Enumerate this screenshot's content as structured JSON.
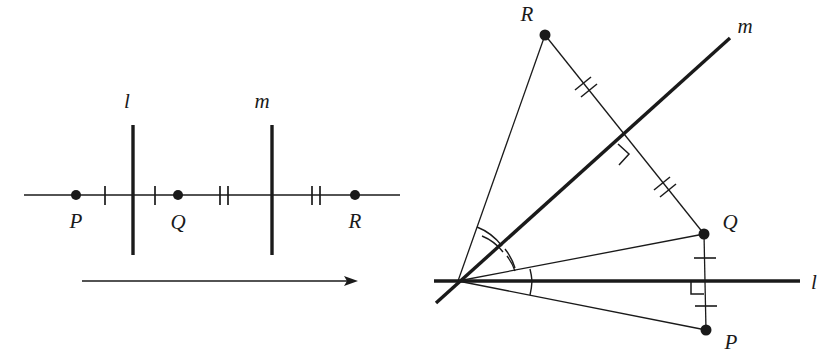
{
  "figure": {
    "background_color": "#ffffff",
    "ink_color": "#1a1a1a",
    "panels": [
      {
        "id": "left",
        "name": "parallel-lines-translation",
        "labels": {
          "line_l": "l",
          "line_m": "m",
          "point_P": "P",
          "point_Q": "Q",
          "point_R": "R"
        },
        "points": [
          {
            "name": "P",
            "label": "P",
            "x": 76,
            "y": 195
          },
          {
            "name": "Q",
            "label": "Q",
            "x": 178,
            "y": 195
          },
          {
            "name": "R",
            "label": "R",
            "x": 355,
            "y": 195
          }
        ],
        "mirror_lines": [
          {
            "name": "l",
            "label": "l",
            "x": 133,
            "y_top": 125,
            "y_bottom": 255
          },
          {
            "name": "m",
            "label": "m",
            "x": 272,
            "y_top": 125,
            "y_bottom": 255
          }
        ],
        "baseline": {
          "x1": 24,
          "x2": 400,
          "y": 195
        },
        "tick_marks": [
          {
            "x": 105,
            "count": 1,
            "between": "P-l"
          },
          {
            "x": 155,
            "count": 1,
            "between": "l-Q"
          },
          {
            "x": 224,
            "count": 2,
            "between": "Q-m"
          },
          {
            "x": 316,
            "count": 2,
            "between": "m-R"
          }
        ],
        "arrow": {
          "name": "translation-arrow",
          "x1": 82,
          "x2": 358,
          "y": 281
        }
      },
      {
        "id": "right",
        "name": "intersecting-lines-rotation",
        "labels": {
          "line_l": "l",
          "line_m": "m",
          "point_P": "P",
          "point_Q": "Q",
          "point_R": "R"
        },
        "vertex": {
          "name": "O",
          "x": 458,
          "y": 281
        },
        "points": [
          {
            "name": "R",
            "label": "R",
            "x": 545,
            "y": 35
          },
          {
            "name": "Q",
            "label": "Q",
            "x": 704,
            "y": 234
          },
          {
            "name": "P",
            "label": "P",
            "x": 706,
            "y": 330
          }
        ],
        "mirror_lines": [
          {
            "name": "l",
            "label": "l",
            "x1": 434,
            "y1": 281,
            "x2": 800,
            "y2": 281
          },
          {
            "name": "m",
            "label": "m",
            "x1": 436,
            "y1": 303,
            "x2": 730,
            "y2": 38
          }
        ],
        "segments": [
          {
            "from": "O",
            "to": "R",
            "name": "ray-OR"
          },
          {
            "from": "O",
            "to": "Q",
            "name": "ray-OQ"
          },
          {
            "from": "O",
            "to": "P",
            "name": "ray-OP"
          },
          {
            "from": "R",
            "to": "Q",
            "name": "segment-RQ"
          },
          {
            "from": "Q",
            "to": "P",
            "name": "segment-QP"
          }
        ],
        "tick_marks": [
          {
            "name": "tick-RQ-upper",
            "count": 2,
            "on": "segment-RQ"
          },
          {
            "name": "tick-RQ-lower",
            "count": 2,
            "on": "segment-RQ"
          },
          {
            "name": "tick-QP-upper",
            "count": 1,
            "on": "segment-QP"
          },
          {
            "name": "tick-QP-lower",
            "count": 1,
            "on": "segment-QP"
          }
        ],
        "right_angle_marks": [
          {
            "name": "right-angle-m-RQ",
            "at": "intersection of m and RQ"
          },
          {
            "name": "right-angle-l-QP",
            "at": "intersection of l and QP"
          }
        ],
        "angle_arcs": [
          {
            "name": "angle-arc-ROm",
            "count": 2
          },
          {
            "name": "angle-arc-mOQ",
            "count": 2
          },
          {
            "name": "angle-arc-QOl",
            "count": 1
          },
          {
            "name": "angle-arc-lOP",
            "count": 1
          }
        ]
      }
    ]
  }
}
